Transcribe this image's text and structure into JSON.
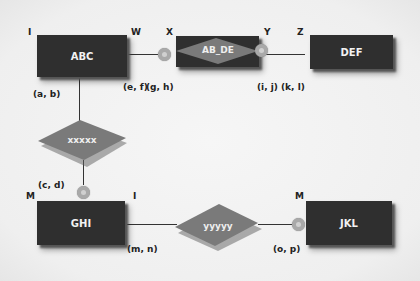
{
  "entities": {
    "abc": {
      "label": "ABC"
    },
    "ab_de": {
      "label": "AB_DE"
    },
    "def": {
      "label": "DEF"
    },
    "ghi": {
      "label": "GHI"
    },
    "jkl": {
      "label": "JKL"
    }
  },
  "relationships": {
    "xxxxx": {
      "label": "xxxxx"
    },
    "yyyyy": {
      "label": "yyyyy"
    }
  },
  "corner_labels": {
    "abc_tl": "I",
    "abc_tr": "W",
    "abde_tl": "X",
    "abde_tr": "Y",
    "def_tl": "Z",
    "ghi_tl": "M",
    "ghi_tr": "I",
    "jkl_tl": "M"
  },
  "coord_labels": {
    "ab": "(a, b)",
    "ef": "(e, f)",
    "gh": "(g, h)",
    "ij": "(i, j)",
    "kl": "(k, l)",
    "cd": "(c, d)",
    "mn": "(m, n)",
    "op": "(o, p)"
  },
  "colors": {
    "entity_fill": "#2f2f2f",
    "relationship_fill": "#7a7a7a",
    "connector": "#a9a9a9",
    "background": "#f2f2f2"
  }
}
